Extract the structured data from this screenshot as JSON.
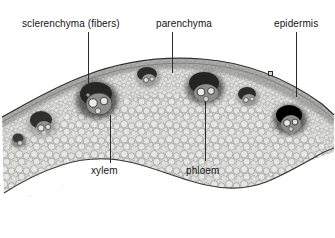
{
  "figure": {
    "kind": "light-micrograph",
    "background_color": "#ffffff",
    "ink_color": "#141414",
    "width": 335,
    "height": 238
  },
  "labels": [
    {
      "id": "sclerenchyma",
      "text": "sclerenchyma (fibers)",
      "x": 22,
      "y": 18,
      "align": "left"
    },
    {
      "id": "parenchyma",
      "text": "parenchyma",
      "x": 156,
      "y": 18,
      "align": "left"
    },
    {
      "id": "epidermis",
      "text": "epidermis",
      "x": 274,
      "y": 18,
      "align": "left"
    },
    {
      "id": "xylem",
      "text": "xylem",
      "x": 91,
      "y": 165,
      "align": "left"
    },
    {
      "id": "phloem",
      "text": "phloem",
      "x": 186,
      "y": 165,
      "align": "left"
    }
  ],
  "leaders": [
    {
      "for": "sclerenchyma",
      "x": 88,
      "y": 32,
      "length": 56
    },
    {
      "for": "parenchyma",
      "x": 172,
      "y": 32,
      "length": 41
    },
    {
      "for": "epidermis",
      "x": 296,
      "y": 32,
      "length": 65
    },
    {
      "for": "xylem",
      "x": 110,
      "y": 115,
      "length": 48
    },
    {
      "for": "phloem",
      "x": 205,
      "y": 101,
      "length": 60
    }
  ],
  "tissue": {
    "name": "stem-cortex-band",
    "fill_light": "#f2f2f0",
    "fill_mid": "#d2d2d0",
    "outline": "#3a3a3a",
    "bundle_dark": "#2e2e2e",
    "bundle_mid": "#6e6e6e"
  },
  "vascular_bundles": [
    {
      "id": "bundle-1",
      "cx": 42,
      "cy": 124,
      "rx": 14,
      "ry": 12
    },
    {
      "id": "bundle-2",
      "cx": 97,
      "cy": 100,
      "rx": 20,
      "ry": 18
    },
    {
      "id": "bundle-3",
      "cx": 148,
      "cy": 77,
      "rx": 12,
      "ry": 10
    },
    {
      "id": "bundle-4",
      "cx": 205,
      "cy": 88,
      "rx": 18,
      "ry": 15
    },
    {
      "id": "bundle-5",
      "cx": 248,
      "cy": 97,
      "rx": 11,
      "ry": 10
    },
    {
      "id": "bundle-6",
      "cx": 290,
      "cy": 120,
      "rx": 16,
      "ry": 14
    },
    {
      "id": "bundle-7",
      "cx": 19,
      "cy": 141,
      "rx": 8,
      "ry": 7
    }
  ]
}
